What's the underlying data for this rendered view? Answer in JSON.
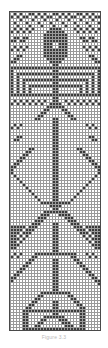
{
  "figure": {
    "type": "pattern-chart",
    "caption": "Figure 3.3",
    "colors": {
      "filled_cell": "#3a3a3a",
      "empty_cell": "#ffffff",
      "grid_line": "#9a9a9a",
      "border": "#4a4a4a",
      "background": "#ffffff",
      "caption_text": "#b9b9b9"
    },
    "grid": {
      "columns": 30,
      "rows": 106,
      "cell_size_px": 3,
      "show_gridlines": true,
      "origin_x_px": 9,
      "origin_y_px": 11,
      "width_px": 90,
      "height_px": 319
    }
  },
  "chart_data": {
    "type": "heatmap",
    "title": "Figure 3.3",
    "xlabel": "",
    "ylabel": "",
    "legend": [],
    "grid": true,
    "columns": 30,
    "rows": 106,
    "value_map": {
      "0": "empty",
      "1": "filled"
    },
    "rows_rle_note": "Each string is one row of 30 cells, '1' = filled (dark), '0' = empty (white), top row first.",
    "cells": [
      "010100110101001101010011010100",
      "101011001010110010101100101011",
      "000100010001000100010001000100",
      "010001000100010001000100010001",
      "001000100010001000100010001000",
      "010101010000011110000101010101",
      "101010100000111111000010101010",
      "000000000001111111100000000000",
      "011011000001111111100001101100",
      "110110000001111111100000110110",
      "000000000001110011100000000000",
      "010101000001110011100000101010",
      "101010000001111111100000010101",
      "000000000001111111100000000000",
      "001100000001111111100000001100",
      "011000000000111111000000000110",
      "110000000000011110000000000011",
      "000000000000001100000000000000",
      "111111111111111111111111111111",
      "100000000000001100000000000001",
      "101111111111111111111111111101",
      "101000000000001100000000000101",
      "101011111111111111111111110101",
      "101010000000001100000000010101",
      "101010111111111111111111010101",
      "101010100000001100000001010101",
      "101010100000001100000001010101",
      "111111111111111111111111111111",
      "000000000000001100000000000000",
      "010101010101001100101010101010",
      "101010101010011110010101010101",
      "000000000000111111000000000000",
      "000000000001100001100000000000",
      "000000000011000000110000000000",
      "000000000110000000011000000000",
      "000000001100001100001100000000",
      "000000000000001100000000000000",
      "010100000000001100000000010100",
      "101000000000001100000000001010",
      "000000000000001100000000000000",
      "000000000000001100000000000000",
      "001100000000001100000000001100",
      "011000000000001100000000000110",
      "000000000000001100000000000000",
      "000000000000001100000000000000",
      "000000110000001100000011000000",
      "000001100000001100000001100000",
      "000011000000001100000000110000",
      "000110000000001100000000011000",
      "001100000000001100000000001100",
      "011000000000001100000000000110",
      "110000000000001100000000000011",
      "100000000000001100000000000001",
      "100000000000001100000000000001",
      "010000000000001100000000000010",
      "001000000000001100000000000100",
      "000100000000001100000000001000",
      "000010000000001100000000010000",
      "000001000000001100000000100000",
      "000000100000001100000001000000",
      "000000010000001100000010000000",
      "000000001000001100000100000000",
      "000000000100001100001000000000",
      "000000000011111111110000000000",
      "000000000000011110000000000000",
      "000000000000001100000000000000",
      "000000000001111111100000000000",
      "000000000011100011110000000000",
      "000000000111000000111000000000",
      "000000001110000000011100000000",
      "000000011100001100001110000000",
      "111110111000001100000111011111",
      "111101110000001100000011101111",
      "111011100000001100000001110111",
      "110101000000001100000000101011",
      "111010000000001100000000010111",
      "110100000000001100000000001011",
      "111000000000001100000000000111",
      "110000000000001100000000000011",
      "000000000000001100000000000000",
      "010100001111111111111100010100",
      "101000011000000000001100001010",
      "000000110000001100000110000000",
      "000001100000001100000011000000",
      "000011000000001100000001100000",
      "000110000000001100000000110000",
      "001100000000001100000000011000",
      "011000000000001100000000001100",
      "110000000000001100000000000110",
      "100000000000001100000000000011",
      "000000000000001100000000000001",
      "000000000000001100000000000000",
      "000000000000001100000000000000",
      "000000000011111111110000000000",
      "000000000110000000011000000000",
      "000000001100000000001100000000",
      "000000011000001100000110000000",
      "000000110000001100000011000000",
      "000001100000001100000001100000",
      "000011111111111111111111100000",
      "000011000000001100000001100000",
      "000011000001111111000001100000",
      "000011000011000011100001100000",
      "000011000110000001110001100000",
      "000011001100000000111001100000",
      "000011111111111111111111100000",
      "010101010101010101010101010101"
    ]
  }
}
